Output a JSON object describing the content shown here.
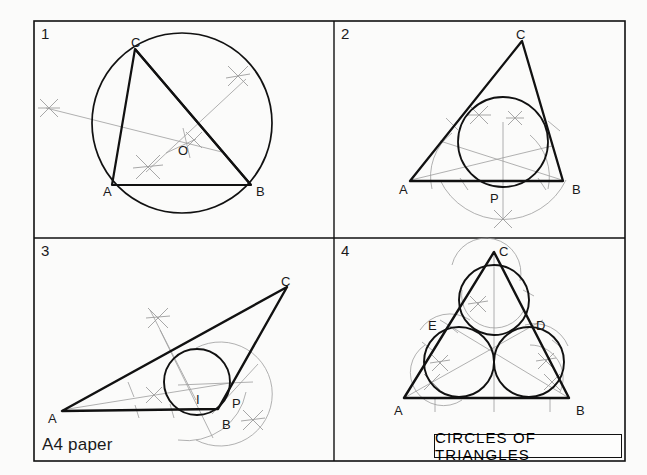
{
  "sheet": {
    "title_block": "CIRCLES  OF  TRIANGLES",
    "paper_note": "A4 paper",
    "background_color": "#fbfbfa",
    "line_color": "#111111",
    "construction_color": "#9a9a9a"
  },
  "panels": [
    {
      "number": "1",
      "subject": "circumscribed-circle",
      "labels": [
        {
          "text": "C",
          "x": 131,
          "y": 36
        },
        {
          "text": "A",
          "x": 103,
          "y": 185
        },
        {
          "text": "B",
          "x": 256,
          "y": 185
        },
        {
          "text": "O",
          "x": 178,
          "y": 144
        }
      ]
    },
    {
      "number": "2",
      "subject": "inscribed-circle",
      "labels": [
        {
          "text": "C",
          "x": 516,
          "y": 28
        },
        {
          "text": "A",
          "x": 399,
          "y": 183
        },
        {
          "text": "B",
          "x": 572,
          "y": 183
        },
        {
          "text": "P",
          "x": 490,
          "y": 192
        }
      ]
    },
    {
      "number": "3",
      "subject": "inscribed-circle-obtuse",
      "labels": [
        {
          "text": "C",
          "x": 281,
          "y": 275
        },
        {
          "text": "A",
          "x": 48,
          "y": 412
        },
        {
          "text": "B",
          "x": 222,
          "y": 418
        },
        {
          "text": "I",
          "x": 196,
          "y": 393
        },
        {
          "text": "P",
          "x": 232,
          "y": 397
        }
      ]
    },
    {
      "number": "4",
      "subject": "three-equal-circles",
      "labels": [
        {
          "text": "C",
          "x": 499,
          "y": 245
        },
        {
          "text": "A",
          "x": 394,
          "y": 404
        },
        {
          "text": "B",
          "x": 576,
          "y": 404
        },
        {
          "text": "E",
          "x": 428,
          "y": 319
        },
        {
          "text": "D",
          "x": 536,
          "y": 319
        }
      ]
    }
  ]
}
